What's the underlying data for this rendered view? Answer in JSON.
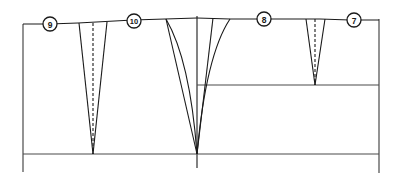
{
  "diagram": {
    "type": "sewing-pattern-draft",
    "colors": {
      "line": "#1a1a1a",
      "guide": "#4a4a4a",
      "background": "#ffffff"
    },
    "labels": [
      {
        "id": "9",
        "text": "9"
      },
      {
        "id": "10",
        "text": "10"
      },
      {
        "id": "8",
        "text": "8"
      },
      {
        "id": "7",
        "text": "7"
      }
    ]
  }
}
